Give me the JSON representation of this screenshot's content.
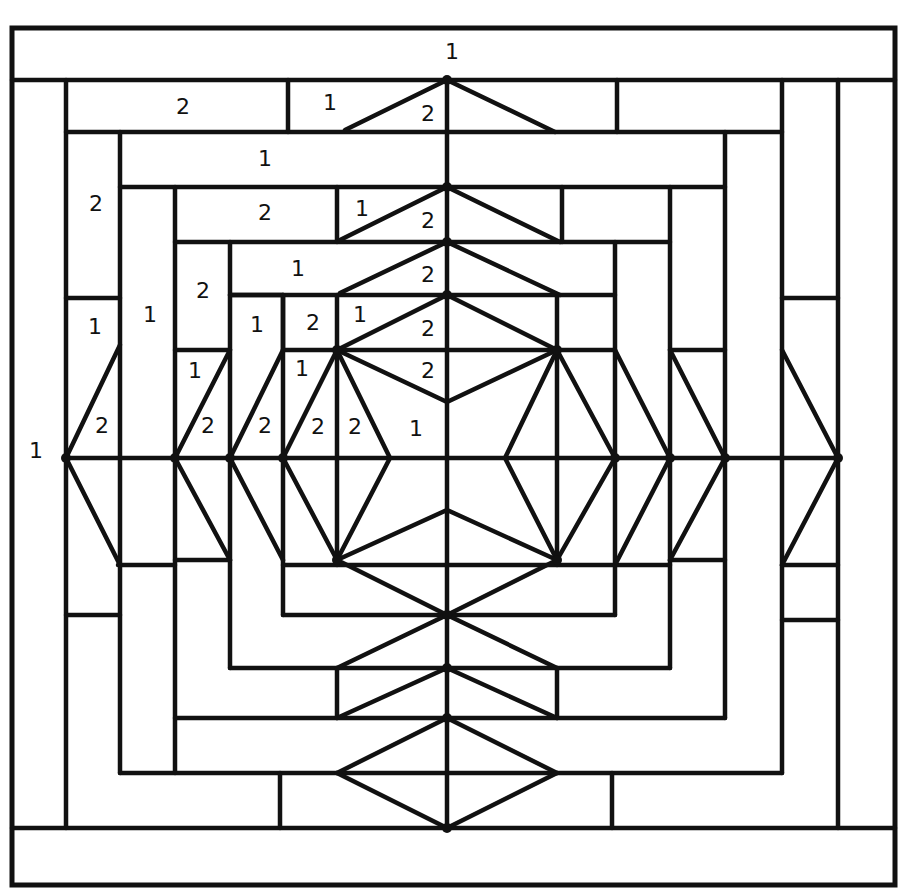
{
  "diagram": {
    "colors": {
      "line": "#111111",
      "background": "#ffffff"
    },
    "frame": {
      "x": 12,
      "y": 28,
      "w": 883,
      "h": 857
    },
    "lines": [
      [
        12,
        80,
        895,
        80
      ],
      [
        12,
        828,
        895,
        828
      ],
      [
        66,
        80,
        66,
        828
      ],
      [
        838,
        80,
        838,
        828
      ],
      [
        66,
        132,
        782,
        132
      ],
      [
        120,
        132,
        120,
        773
      ],
      [
        782,
        80,
        782,
        773
      ],
      [
        120,
        773,
        782,
        773
      ],
      [
        288,
        80,
        288,
        132
      ],
      [
        617,
        80,
        617,
        132
      ],
      [
        782,
        298,
        838,
        298
      ],
      [
        782,
        620,
        838,
        620
      ],
      [
        66,
        615,
        120,
        615
      ],
      [
        66,
        298,
        120,
        298
      ],
      [
        120,
        187,
        725,
        187
      ],
      [
        175,
        187,
        175,
        773
      ],
      [
        725,
        132,
        725,
        718
      ],
      [
        175,
        718,
        725,
        718
      ],
      [
        175,
        242,
        670,
        242
      ],
      [
        230,
        242,
        230,
        668
      ],
      [
        670,
        187,
        670,
        668
      ],
      [
        230,
        668,
        670,
        668
      ],
      [
        337,
        187,
        337,
        242
      ],
      [
        562,
        187,
        562,
        242
      ],
      [
        230,
        295,
        615,
        295
      ],
      [
        283,
        295,
        283,
        615
      ],
      [
        615,
        242,
        615,
        615
      ],
      [
        283,
        615,
        615,
        615
      ],
      [
        283,
        350,
        615,
        350
      ],
      [
        283,
        565,
        615,
        565
      ],
      [
        337,
        295,
        337,
        565
      ],
      [
        557,
        295,
        557,
        565
      ],
      [
        175,
        350,
        230,
        350
      ],
      [
        175,
        560,
        230,
        560
      ],
      [
        670,
        350,
        725,
        350
      ],
      [
        670,
        560,
        725,
        560
      ],
      [
        615,
        565,
        670,
        565
      ],
      [
        230,
        295,
        283,
        295
      ],
      [
        283,
        295,
        283,
        350
      ],
      [
        447,
        80,
        447,
        828
      ],
      [
        66,
        458,
        838,
        458
      ],
      [
        118,
        565,
        175,
        565
      ],
      [
        782,
        565,
        838,
        565
      ],
      [
        337,
        668,
        337,
        718
      ],
      [
        557,
        668,
        557,
        718
      ],
      [
        280,
        773,
        280,
        828
      ],
      [
        612,
        773,
        612,
        828
      ],
      [
        447,
        80,
        345,
        130
      ],
      [
        447,
        80,
        555,
        132
      ],
      [
        447,
        187,
        340,
        240
      ],
      [
        447,
        187,
        560,
        242
      ],
      [
        447,
        242,
        340,
        293
      ],
      [
        447,
        242,
        560,
        295
      ],
      [
        447,
        295,
        337,
        350
      ],
      [
        447,
        295,
        557,
        350
      ],
      [
        337,
        350,
        447,
        402
      ],
      [
        557,
        350,
        447,
        402
      ],
      [
        337,
        350,
        283,
        458
      ],
      [
        337,
        350,
        390,
        458
      ],
      [
        557,
        350,
        505,
        458
      ],
      [
        557,
        350,
        615,
        458
      ],
      [
        283,
        458,
        337,
        560
      ],
      [
        390,
        458,
        337,
        560
      ],
      [
        505,
        458,
        557,
        560
      ],
      [
        615,
        458,
        557,
        560
      ],
      [
        337,
        560,
        447,
        510
      ],
      [
        557,
        560,
        447,
        510
      ],
      [
        337,
        560,
        447,
        615
      ],
      [
        557,
        560,
        447,
        615
      ],
      [
        447,
        615,
        337,
        668
      ],
      [
        447,
        615,
        557,
        668
      ],
      [
        447,
        668,
        337,
        718
      ],
      [
        447,
        668,
        557,
        718
      ],
      [
        447,
        718,
        337,
        773
      ],
      [
        447,
        718,
        557,
        773
      ],
      [
        447,
        828,
        337,
        773
      ],
      [
        447,
        828,
        557,
        773
      ],
      [
        66,
        458,
        120,
        345
      ],
      [
        66,
        458,
        120,
        565
      ],
      [
        175,
        458,
        230,
        350
      ],
      [
        175,
        458,
        230,
        560
      ],
      [
        230,
        458,
        283,
        350
      ],
      [
        230,
        458,
        283,
        560
      ],
      [
        670,
        458,
        615,
        350
      ],
      [
        670,
        458,
        615,
        565
      ],
      [
        725,
        458,
        670,
        350
      ],
      [
        725,
        458,
        670,
        560
      ],
      [
        838,
        458,
        782,
        350
      ],
      [
        838,
        458,
        782,
        565
      ]
    ],
    "nodes": [
      [
        447,
        80
      ],
      [
        447,
        187
      ],
      [
        447,
        242
      ],
      [
        447,
        295
      ],
      [
        337,
        350
      ],
      [
        557,
        350
      ],
      [
        337,
        560
      ],
      [
        557,
        560
      ],
      [
        447,
        615
      ],
      [
        447,
        668
      ],
      [
        447,
        718
      ],
      [
        447,
        828
      ],
      [
        66,
        458
      ],
      [
        175,
        458
      ],
      [
        230,
        458
      ],
      [
        283,
        458
      ],
      [
        615,
        458
      ],
      [
        670,
        458
      ],
      [
        725,
        458
      ],
      [
        838,
        458
      ]
    ],
    "labels": [
      {
        "x": 452,
        "y": 53,
        "text": "1"
      },
      {
        "x": 183,
        "y": 108,
        "text": "2"
      },
      {
        "x": 330,
        "y": 104,
        "text": "1"
      },
      {
        "x": 428,
        "y": 115,
        "text": "2"
      },
      {
        "x": 265,
        "y": 160,
        "text": "1"
      },
      {
        "x": 96,
        "y": 205,
        "text": "2"
      },
      {
        "x": 265,
        "y": 214,
        "text": "2"
      },
      {
        "x": 362,
        "y": 210,
        "text": "1"
      },
      {
        "x": 428,
        "y": 222,
        "text": "2"
      },
      {
        "x": 203,
        "y": 292,
        "text": "2"
      },
      {
        "x": 298,
        "y": 270,
        "text": "1"
      },
      {
        "x": 428,
        "y": 276,
        "text": "2"
      },
      {
        "x": 95,
        "y": 328,
        "text": "1"
      },
      {
        "x": 150,
        "y": 316,
        "text": "1"
      },
      {
        "x": 257,
        "y": 326,
        "text": "1"
      },
      {
        "x": 313,
        "y": 324,
        "text": "2"
      },
      {
        "x": 360,
        "y": 316,
        "text": "1"
      },
      {
        "x": 428,
        "y": 330,
        "text": "2"
      },
      {
        "x": 195,
        "y": 372,
        "text": "1"
      },
      {
        "x": 302,
        "y": 370,
        "text": "1"
      },
      {
        "x": 428,
        "y": 372,
        "text": "2"
      },
      {
        "x": 102,
        "y": 427,
        "text": "2"
      },
      {
        "x": 208,
        "y": 427,
        "text": "2"
      },
      {
        "x": 265,
        "y": 427,
        "text": "2"
      },
      {
        "x": 318,
        "y": 428,
        "text": "2"
      },
      {
        "x": 355,
        "y": 428,
        "text": "2"
      },
      {
        "x": 416,
        "y": 430,
        "text": "1"
      },
      {
        "x": 36,
        "y": 452,
        "text": "1"
      }
    ]
  }
}
